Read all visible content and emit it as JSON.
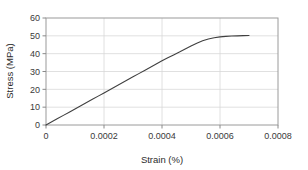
{
  "chart_data": {
    "type": "line",
    "title": "",
    "xlabel": "Strain (%)",
    "ylabel": "Stress (MPa)",
    "xlim": [
      0,
      0.0008
    ],
    "ylim": [
      0,
      60
    ],
    "xticks": [
      "0",
      "0.0002",
      "0.0004",
      "0.0006",
      "0.0008"
    ],
    "xtick_values": [
      0,
      0.0002,
      0.0004,
      0.0006,
      0.0008
    ],
    "yticks": [
      "0",
      "10",
      "20",
      "30",
      "40",
      "50",
      "60"
    ],
    "ytick_values": [
      0,
      10,
      20,
      30,
      40,
      50,
      60
    ],
    "grid": true,
    "legend": "none",
    "series": [
      {
        "name": "stress-strain",
        "color": "#404040",
        "x": [
          0,
          2e-05,
          4e-05,
          6e-05,
          8e-05,
          0.0001,
          0.00012,
          0.00014,
          0.00016,
          0.00018,
          0.0002,
          0.00022,
          0.00024,
          0.00026,
          0.00028,
          0.0003,
          0.00032,
          0.00034,
          0.00036,
          0.00038,
          0.0004,
          0.00042,
          0.00044,
          0.00046,
          0.00048,
          0.0005,
          0.00052,
          0.00054,
          0.00056,
          0.00058,
          0.0006,
          0.00062,
          0.00064,
          0.00066,
          0.00068,
          0.0007
        ],
        "y": [
          0,
          1.8,
          3.6,
          5.4,
          7.2,
          9.0,
          10.8,
          12.6,
          14.4,
          16.2,
          18.0,
          19.8,
          21.6,
          23.4,
          25.2,
          27.0,
          28.8,
          30.6,
          32.4,
          34.2,
          36.0,
          37.7,
          39.3,
          40.9,
          42.6,
          44.3,
          45.9,
          47.2,
          48.2,
          48.9,
          49.4,
          49.7,
          49.9,
          50.0,
          50.1,
          50.2
        ]
      }
    ]
  },
  "colors": {
    "curve": "#404040",
    "grid": "#d8d8d8",
    "axis": "#8a8a8a",
    "text": "#3a3a3a",
    "background": "#ffffff"
  }
}
